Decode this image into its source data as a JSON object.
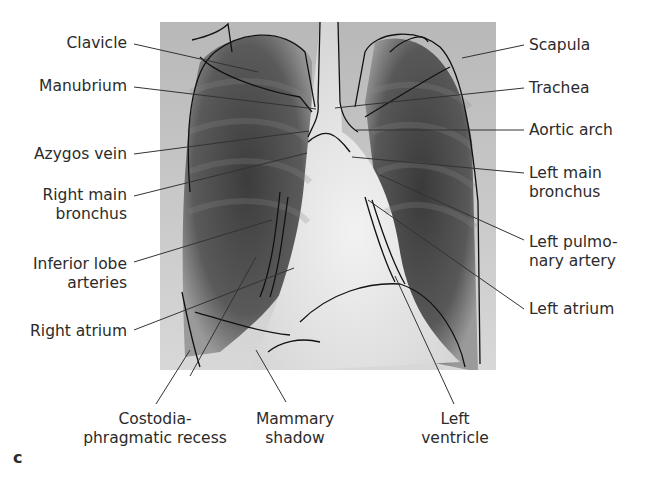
{
  "figure": {
    "panel_letter": "c",
    "image_description": "Chest radiograph (PA view) with anatomical outline tracing"
  },
  "labels": {
    "left": [
      {
        "id": "clavicle",
        "lines": [
          "Clavicle"
        ]
      },
      {
        "id": "manubrium",
        "lines": [
          "Manubrium"
        ]
      },
      {
        "id": "azygos_vein",
        "lines": [
          "Azygos vein"
        ]
      },
      {
        "id": "right_main_bronchus",
        "lines": [
          "Right main",
          "bronchus"
        ]
      },
      {
        "id": "inferior_lobe_arteries",
        "lines": [
          "Inferior lobe",
          "arteries"
        ]
      },
      {
        "id": "right_atrium",
        "lines": [
          "Right atrium"
        ]
      }
    ],
    "right": [
      {
        "id": "scapula",
        "lines": [
          "Scapula"
        ]
      },
      {
        "id": "trachea",
        "lines": [
          "Trachea"
        ]
      },
      {
        "id": "aortic_arch",
        "lines": [
          "Aortic arch"
        ]
      },
      {
        "id": "left_main_bronchus",
        "lines": [
          "Left main",
          "bronchus"
        ]
      },
      {
        "id": "left_pulmonary_artery",
        "lines": [
          "Left pulmo-",
          "nary artery"
        ]
      },
      {
        "id": "left_atrium",
        "lines": [
          "Left atrium"
        ]
      }
    ],
    "bottom": [
      {
        "id": "costodiaphragmatic_recess",
        "lines": [
          "Costodia-",
          "phragmatic recess"
        ]
      },
      {
        "id": "mammary_shadow",
        "lines": [
          "Mammary",
          "shadow"
        ]
      },
      {
        "id": "left_ventricle",
        "lines": [
          "Left",
          "ventricle"
        ]
      }
    ]
  }
}
